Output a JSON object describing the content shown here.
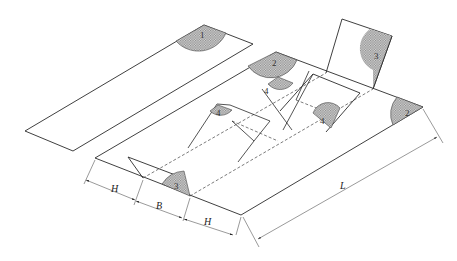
{
  "diagram": {
    "type": "isometric sheet-folding layout",
    "colors": {
      "line": "#2a2a2a",
      "hatch": "#9a9a9a",
      "dim_line": "#555555",
      "background": "#ffffff"
    },
    "regions": [
      {
        "id": "1",
        "label": "1",
        "location": "separate strip, top corner"
      },
      {
        "id": "2a",
        "label": "2",
        "location": "main plate, top corner"
      },
      {
        "id": "2b",
        "label": "2",
        "location": "main plate, right corner"
      },
      {
        "id": "3a",
        "label": "3",
        "location": "upright flap, top right"
      },
      {
        "id": "3b",
        "label": "3",
        "location": "front flap, lower left"
      },
      {
        "id": "4a",
        "label": "4",
        "location": "inner fold, upper"
      },
      {
        "id": "4b",
        "label": "4",
        "location": "inner fold, left"
      },
      {
        "id": "4c",
        "label": "4",
        "location": "inner fold, right"
      }
    ],
    "dimensions": [
      {
        "label": "H",
        "position": "left segment"
      },
      {
        "label": "B",
        "position": "middle segment"
      },
      {
        "label": "H",
        "position": "right segment"
      },
      {
        "label": "L",
        "position": "overall length"
      }
    ]
  }
}
